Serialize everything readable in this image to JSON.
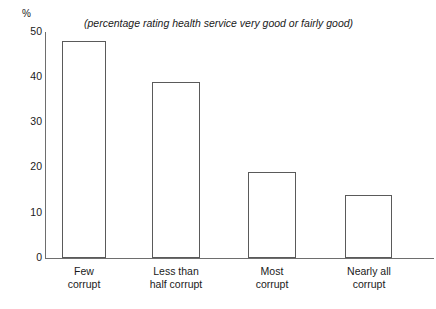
{
  "chart_data": {
    "type": "bar",
    "title": "(percentage rating health service very good or fairly good)",
    "xlabel": "",
    "ylabel": "%",
    "ylim": [
      0,
      50
    ],
    "yticks": [
      0,
      10,
      20,
      30,
      40,
      50
    ],
    "grid": false,
    "legend": "none",
    "orientation": "vertical",
    "categories": [
      "Few corrupt",
      "Less than half corrupt",
      "Most corrupt",
      "Nearly all corrupt"
    ],
    "category_lines": [
      [
        "Few",
        "corrupt"
      ],
      [
        "Less than",
        "half corrupt"
      ],
      [
        "Most",
        "corrupt"
      ],
      [
        "Nearly all",
        "corrupt"
      ]
    ],
    "values": [
      48,
      39,
      19,
      14
    ],
    "bar_style": {
      "fill": "#ffffff",
      "stroke": "#5a5a5a"
    }
  },
  "axis": {
    "unit_label": "%",
    "tick_0": "0",
    "tick_10": "10",
    "tick_20": "20",
    "tick_30": "30",
    "tick_40": "40",
    "tick_50": "50"
  },
  "labels": {
    "cat1_line1": "Few",
    "cat1_line2": "corrupt",
    "cat2_line1": "Less than",
    "cat2_line2": "half corrupt",
    "cat3_line1": "Most",
    "cat3_line2": "corrupt",
    "cat4_line1": "Nearly all",
    "cat4_line2": "corrupt"
  },
  "colors": {
    "axis": "#6e6e6e",
    "bar_stroke": "#5a5a5a",
    "bar_fill": "#ffffff",
    "text": "#1a1a1a",
    "background": "#ffffff"
  }
}
